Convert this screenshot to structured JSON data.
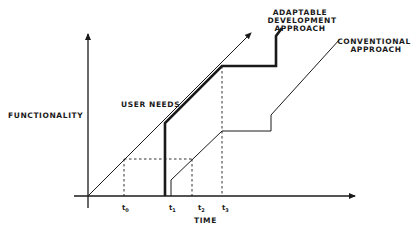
{
  "diagram": {
    "y_axis_label": "FUNCTIONALITY",
    "x_axis_label": "TIME",
    "series": {
      "user_needs": "USER NEEDS",
      "adaptable_line1": "ADAPTABLE",
      "adaptable_line2": "DEVELOPMENT",
      "adaptable_line3": "APPROACH",
      "conventional_line1": "CONVENTIONAL",
      "conventional_line2": "APPROACH"
    },
    "ticks": [
      {
        "base": "t",
        "sub": "0"
      },
      {
        "base": "t",
        "sub": "1"
      },
      {
        "base": "t",
        "sub": "2"
      },
      {
        "base": "t",
        "sub": "3"
      }
    ],
    "colors": {
      "ink": "#1a1a1a",
      "background": "#ffffff"
    }
  }
}
